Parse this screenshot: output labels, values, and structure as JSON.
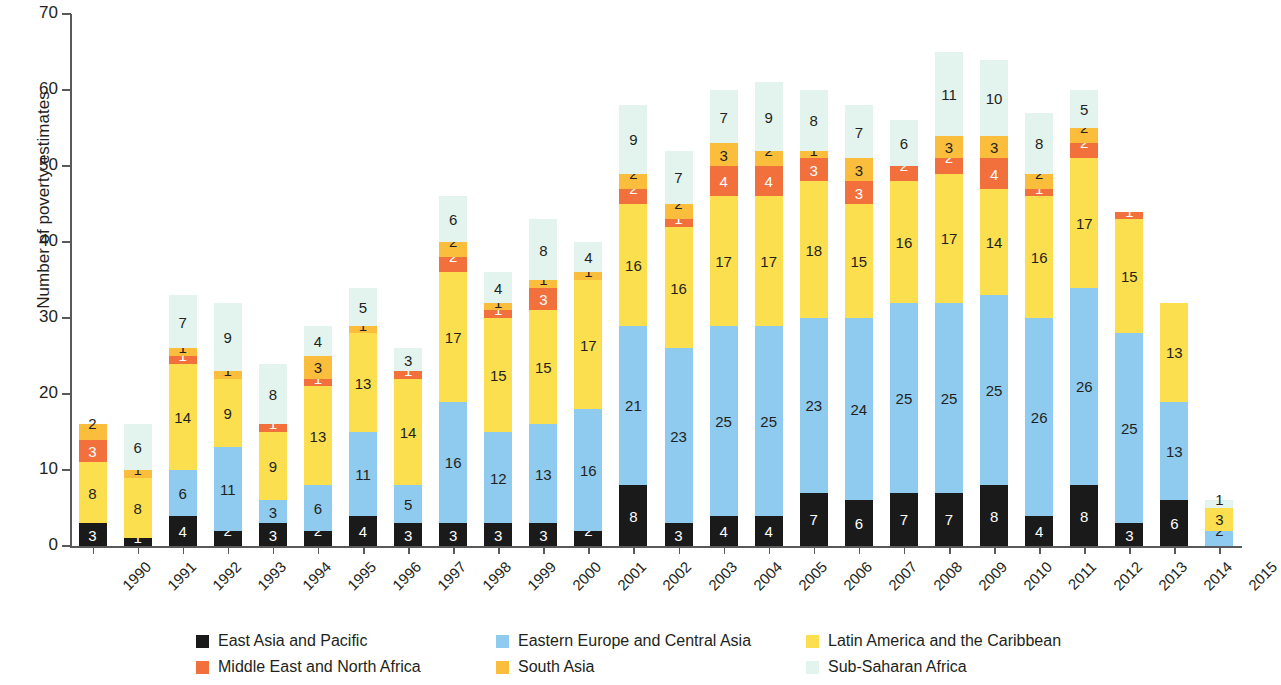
{
  "chart_data": {
    "type": "bar",
    "stacked": true,
    "title": "",
    "xlabel": "",
    "ylabel": "Number of poverty estimates",
    "ylim": [
      0,
      70
    ],
    "yticks": [
      0,
      10,
      20,
      30,
      40,
      50,
      60,
      70
    ],
    "grid": false,
    "legend_position": "bottom",
    "categories": [
      "1990",
      "1991",
      "1992",
      "1993",
      "1994",
      "1995",
      "1996",
      "1997",
      "1998",
      "1999",
      "2000",
      "2001",
      "2002",
      "2003",
      "2004",
      "2005",
      "2006",
      "2007",
      "2008",
      "2009",
      "2010",
      "2011",
      "2012",
      "2013",
      "2014",
      "2015"
    ],
    "series": [
      {
        "name": "East Asia and Pacific",
        "color": "#1a1a1a",
        "text_color": "#ffffff",
        "values": [
          3,
          1,
          4,
          2,
          3,
          2,
          4,
          3,
          3,
          3,
          3,
          2,
          8,
          3,
          4,
          4,
          7,
          6,
          7,
          7,
          8,
          4,
          8,
          3,
          6,
          0
        ]
      },
      {
        "name": "Eastern Europe and Central Asia",
        "color": "#8ecbef",
        "text_color": "#231f20",
        "values": [
          0,
          0,
          6,
          11,
          3,
          6,
          11,
          5,
          16,
          12,
          13,
          16,
          21,
          23,
          25,
          25,
          23,
          24,
          25,
          25,
          25,
          26,
          26,
          25,
          13,
          2
        ]
      },
      {
        "name": "Latin America and the Caribbean",
        "color": "#fcdf4f",
        "text_color": "#231f20",
        "values": [
          8,
          8,
          14,
          9,
          9,
          13,
          13,
          14,
          17,
          15,
          15,
          17,
          16,
          16,
          17,
          17,
          18,
          15,
          16,
          17,
          14,
          16,
          17,
          15,
          13,
          3
        ]
      },
      {
        "name": "Middle East and North Africa",
        "color": "#f2703c",
        "text_color": "#ffffff",
        "values": [
          3,
          0,
          1,
          0,
          1,
          1,
          0,
          1,
          2,
          1,
          3,
          0,
          2,
          1,
          4,
          4,
          3,
          3,
          2,
          2,
          4,
          1,
          2,
          1,
          0,
          0
        ]
      },
      {
        "name": "South Asia",
        "color": "#fbbe3c",
        "text_color": "#231f20",
        "values": [
          2,
          1,
          1,
          1,
          0,
          3,
          1,
          0,
          2,
          1,
          1,
          1,
          2,
          2,
          3,
          2,
          1,
          3,
          0,
          3,
          3,
          2,
          2,
          0,
          0,
          0
        ]
      },
      {
        "name": "Sub-Saharan Africa",
        "color": "#e3f4ef",
        "text_color": "#231f20",
        "values": [
          0,
          6,
          7,
          9,
          8,
          4,
          5,
          3,
          6,
          4,
          8,
          4,
          9,
          7,
          7,
          9,
          8,
          7,
          6,
          11,
          10,
          8,
          5,
          0,
          0,
          1
        ]
      }
    ],
    "totals": [
      16,
      10,
      33,
      32,
      24,
      29,
      34,
      26,
      46,
      36,
      43,
      40,
      58,
      52,
      60,
      61,
      60,
      58,
      56,
      65,
      64,
      57,
      60,
      44,
      32,
      6
    ]
  },
  "legend": {
    "items": [
      {
        "label": "East Asia and Pacific",
        "color": "#1a1a1a"
      },
      {
        "label": "Eastern Europe and Central Asia",
        "color": "#8ecbef"
      },
      {
        "label": "Latin America and the Caribbean",
        "color": "#fcdf4f"
      },
      {
        "label": "Middle East and North Africa",
        "color": "#f2703c"
      },
      {
        "label": "South Asia",
        "color": "#fbbe3c"
      },
      {
        "label": "Sub-Saharan Africa",
        "color": "#e3f4ef"
      }
    ]
  },
  "axes": {
    "y_title": "Number of poverty estimates"
  }
}
